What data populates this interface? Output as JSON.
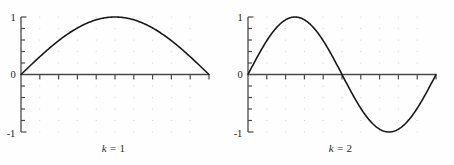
{
  "figure": {
    "background": "#fefefe",
    "curve_color": "#1a1a1a",
    "axis_color": "#4a4a4a",
    "grid_color": "#c9c9c9"
  },
  "panels": [
    {
      "id": "left",
      "caption_var": "k",
      "caption_eq": " = 1",
      "caption_full": "k = 1",
      "ytick_labels": [
        "1",
        "0",
        "-1"
      ],
      "chart_data": {
        "type": "line",
        "title": "k = 1",
        "xlabel": "",
        "ylabel": "",
        "xlim": [
          0,
          1
        ],
        "ylim": [
          -1,
          1
        ],
        "yticks": [
          -1,
          0,
          1
        ],
        "ytick_labels": [
          "-1",
          "0",
          "1"
        ],
        "xticks": [
          0,
          0.1,
          0.2,
          0.3,
          0.4,
          0.5,
          0.6,
          0.7,
          0.8,
          0.9,
          1.0
        ],
        "xtick_labels": [],
        "grid": "dotted",
        "legend": "none",
        "series": [
          {
            "name": "sin(1*pi*x)",
            "x": [
              0,
              0.05,
              0.1,
              0.15,
              0.2,
              0.25,
              0.3,
              0.35,
              0.4,
              0.45,
              0.5,
              0.55,
              0.6,
              0.65,
              0.7,
              0.75,
              0.8,
              0.85,
              0.9,
              0.95,
              1
            ],
            "values": [
              0,
              0.156,
              0.309,
              0.454,
              0.588,
              0.707,
              0.809,
              0.891,
              0.951,
              0.988,
              1,
              0.988,
              0.951,
              0.891,
              0.809,
              0.707,
              0.588,
              0.454,
              0.309,
              0.156,
              0
            ]
          }
        ]
      }
    },
    {
      "id": "right",
      "caption_var": "k",
      "caption_eq": " = 2",
      "caption_full": "k = 2",
      "ytick_labels": [
        "1",
        "0",
        "-1"
      ],
      "chart_data": {
        "type": "line",
        "title": "k = 2",
        "xlabel": "",
        "ylabel": "",
        "xlim": [
          0,
          1
        ],
        "ylim": [
          -1,
          1
        ],
        "yticks": [
          -1,
          0,
          1
        ],
        "ytick_labels": [
          "-1",
          "0",
          "1"
        ],
        "xticks": [
          0,
          0.1,
          0.2,
          0.3,
          0.4,
          0.5,
          0.6,
          0.7,
          0.8,
          0.9,
          1.0
        ],
        "xtick_labels": [],
        "grid": "dotted",
        "legend": "none",
        "series": [
          {
            "name": "sin(2*pi*x)",
            "x": [
              0,
              0.05,
              0.1,
              0.15,
              0.2,
              0.25,
              0.3,
              0.35,
              0.4,
              0.45,
              0.5,
              0.55,
              0.6,
              0.65,
              0.7,
              0.75,
              0.8,
              0.85,
              0.9,
              0.95,
              1
            ],
            "values": [
              0,
              0.309,
              0.588,
              0.809,
              0.951,
              1,
              0.951,
              0.809,
              0.588,
              0.309,
              0,
              -0.309,
              -0.588,
              -0.809,
              -0.951,
              -1,
              -0.951,
              -0.809,
              -0.588,
              -0.309,
              0
            ]
          }
        ]
      }
    }
  ]
}
